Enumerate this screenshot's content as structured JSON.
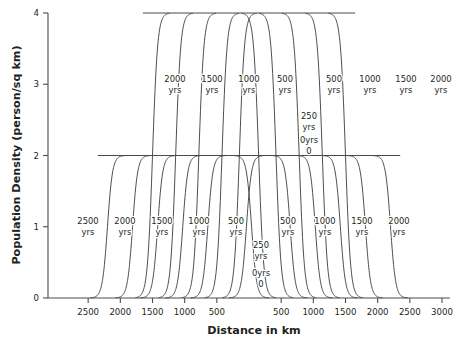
{
  "chart_data": {
    "type": "line",
    "title": "",
    "xlabel": "Distance in km",
    "ylabel": "Population Density (person/sq km)",
    "xlim": [
      -3050,
      3050
    ],
    "ylim": [
      0,
      4
    ],
    "grid": false,
    "legend_position": "inline-annotations",
    "x_tick_labels": [
      "2500",
      "2000",
      "1500",
      "1000",
      "500",
      "500",
      "1000",
      "1500",
      "2000",
      "2500",
      "3000"
    ],
    "x_tick_values": [
      -2500,
      -2000,
      -1500,
      -1000,
      -500,
      500,
      1000,
      1500,
      2000,
      2500,
      3000
    ],
    "y_tick_labels": [
      "0",
      "1",
      "2",
      "3",
      "4"
    ],
    "y_tick_values": [
      0,
      1,
      2,
      3,
      4
    ],
    "series": [
      {
        "name": "0yrs",
        "label": "0yrs",
        "level": 2,
        "half_width": 40,
        "side": "both"
      },
      {
        "name": "250 yrs",
        "label": "250 yrs",
        "level": 4,
        "half_width": 150,
        "side": "both"
      },
      {
        "name": "500 yrs inner",
        "label": "500 yrs",
        "level": 4,
        "half_width": 420,
        "side": "both"
      },
      {
        "name": "1000 yrs inner",
        "label": "1000 yrs",
        "level": 4,
        "half_width": 780,
        "side": "both"
      },
      {
        "name": "1500 yrs inner",
        "label": "1500 yrs",
        "level": 4,
        "half_width": 1140,
        "side": "both"
      },
      {
        "name": "2000 yrs inner",
        "label": "2000 yrs",
        "level": 4,
        "half_width": 1500,
        "side": "both"
      },
      {
        "name": "500 yrs outer",
        "label": "500 yrs",
        "level": 2,
        "half_width": 640,
        "side": "both"
      },
      {
        "name": "1000 yrs outer",
        "label": "1000 yrs",
        "level": 2,
        "half_width": 1030,
        "side": "both"
      },
      {
        "name": "1500 yrs outer",
        "label": "1500 yrs",
        "level": 2,
        "half_width": 1420,
        "side": "both"
      },
      {
        "name": "2000 yrs outer",
        "label": "2000 yrs",
        "level": 2,
        "half_width": 1810,
        "side": "both"
      },
      {
        "name": "2500 yrs outer",
        "label": "2500 yrs",
        "level": 2,
        "half_width": 2200,
        "side": "both"
      }
    ],
    "annotations": [
      {
        "text": "2000",
        "text2": "yrs",
        "x": 175,
        "y": 82
      },
      {
        "text": "1500",
        "text2": "yrs",
        "x": 212,
        "y": 82
      },
      {
        "text": "1000",
        "text2": "yrs",
        "x": 249,
        "y": 82
      },
      {
        "text": "500",
        "text2": "yrs",
        "x": 285,
        "y": 82
      },
      {
        "text": "500",
        "text2": "yrs",
        "x": 334,
        "y": 82
      },
      {
        "text": "1000",
        "text2": "yrs",
        "x": 370,
        "y": 82
      },
      {
        "text": "1500",
        "text2": "yrs",
        "x": 406,
        "y": 82
      },
      {
        "text": "2000",
        "text2": "yrs",
        "x": 441,
        "y": 82
      },
      {
        "text": "250",
        "text2": "yrs",
        "x": 309,
        "y": 119
      },
      {
        "text": "0yrs",
        "text2": "0",
        "x": 309,
        "y": 143
      },
      {
        "text": "2500",
        "text2": "yrs",
        "x": 88,
        "y": 224
      },
      {
        "text": "2000",
        "text2": "yrs",
        "x": 125,
        "y": 224
      },
      {
        "text": "1500",
        "text2": "yrs",
        "x": 162,
        "y": 224
      },
      {
        "text": "1000",
        "text2": "yrs",
        "x": 199,
        "y": 224
      },
      {
        "text": "500",
        "text2": "yrs",
        "x": 236,
        "y": 224
      },
      {
        "text": "500",
        "text2": "yrs",
        "x": 288,
        "y": 224
      },
      {
        "text": "1000",
        "text2": "yrs",
        "x": 325,
        "y": 224
      },
      {
        "text": "1500",
        "text2": "yrs",
        "x": 362,
        "y": 224
      },
      {
        "text": "2000",
        "text2": "yrs",
        "x": 399,
        "y": 224
      },
      {
        "text": "250",
        "text2": "yrs",
        "x": 261,
        "y": 248
      },
      {
        "text": "0yrs",
        "text2": "0",
        "x": 261,
        "y": 276
      }
    ]
  }
}
